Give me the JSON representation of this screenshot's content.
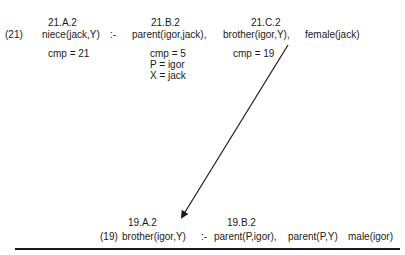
{
  "clause21": {
    "number": "(21)",
    "neck": ":-",
    "head": {
      "label": "21.A.2",
      "text": "niece(jack,Y)",
      "annotations": [
        "cmp = 21"
      ]
    },
    "body": [
      {
        "label": "21.B.2",
        "text": "parent(igor,jack),",
        "annotations": [
          "cmp = 5",
          "P = igor",
          "X = jack"
        ]
      },
      {
        "label": "21.C.2",
        "text": "brother(igor,Y),",
        "annotations": [
          "cmp = 19"
        ]
      },
      {
        "label": "",
        "text": "female(jack)",
        "annotations": []
      }
    ]
  },
  "clause19": {
    "number": "(19)",
    "neck": ":-",
    "head": {
      "label": "19.A.2",
      "text": "brother(igor,Y)"
    },
    "body": [
      {
        "label": "19.B.2",
        "text": "parent(P,igor),"
      },
      {
        "label": "",
        "text": "parent(P,Y)"
      },
      {
        "label": "",
        "text": "male(igor)"
      }
    ]
  },
  "arrow": {
    "from": "21.C.2",
    "to": "19.A.2",
    "color": "#1a1a1a"
  },
  "separator": {
    "color": "#1a1a1a"
  }
}
